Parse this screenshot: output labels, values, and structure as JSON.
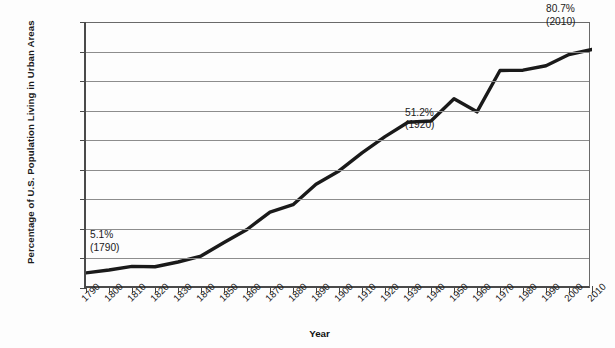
{
  "chart_data": {
    "type": "line",
    "title": "",
    "xlabel": "Year",
    "ylabel": "Percentage of U.S. Population Living in Urban Areas",
    "x": [
      1790,
      1800,
      1810,
      1820,
      1830,
      1840,
      1850,
      1860,
      1870,
      1880,
      1890,
      1900,
      1910,
      1920,
      1930,
      1940,
      1950,
      1960,
      1970,
      1980,
      1990,
      2000,
      2010
    ],
    "values": [
      5.1,
      6.1,
      7.3,
      7.2,
      8.8,
      10.8,
      15.4,
      19.8,
      25.7,
      28.2,
      35.1,
      39.6,
      45.7,
      51.2,
      56.1,
      56.5,
      64.0,
      59.6,
      73.6,
      73.7,
      75.2,
      79.0,
      80.7
    ],
    "categories": [
      "1790",
      "1800",
      "1810",
      "1820",
      "1830",
      "1840",
      "1850",
      "1860",
      "1870",
      "1880",
      "1890",
      "1900",
      "1910",
      "1920",
      "1930",
      "1940",
      "1950",
      "1960",
      "1970",
      "1980",
      "1990",
      "2000",
      "2010"
    ],
    "ylim": [
      0,
      90
    ],
    "xlim": [
      1790,
      2010
    ],
    "yticks": [
      0,
      10,
      20,
      30,
      40,
      50,
      60,
      70,
      80,
      90
    ],
    "ytick_labels": [
      "0%",
      "10%",
      "20%",
      "30%",
      "40%",
      "50%",
      "60%",
      "70%",
      "80%",
      "90%"
    ],
    "grid": true,
    "legend": false,
    "line_color": "#1a1a1a",
    "annotations": [
      {
        "name": "start-annotation",
        "value": "5.1%",
        "year": "(1790)"
      },
      {
        "name": "midpoint-annotation",
        "value": "51.2%",
        "year": "(1920)"
      },
      {
        "name": "end-annotation",
        "value": "80.7%",
        "year": "(2010)"
      }
    ]
  },
  "axis": {
    "y_title": "Percentage of U.S. Population Living in Urban Areas",
    "x_title": "Year"
  }
}
